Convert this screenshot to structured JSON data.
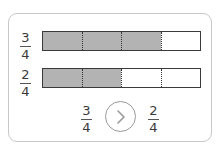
{
  "colors": {
    "filled": "#b3b3b3",
    "border": "#3a3a3a",
    "card_border": "#c8c8c8",
    "circle_border": "#9a9a9a"
  },
  "rows": [
    {
      "numerator": "3",
      "denominator": "4",
      "parts": 4,
      "shaded": 3
    },
    {
      "numerator": "2",
      "denominator": "4",
      "parts": 4,
      "shaded": 2
    }
  ],
  "comparison": {
    "left": {
      "numerator": "3",
      "denominator": "4"
    },
    "symbol_icon": "greater-than-icon",
    "right": {
      "numerator": "2",
      "denominator": "4"
    }
  }
}
